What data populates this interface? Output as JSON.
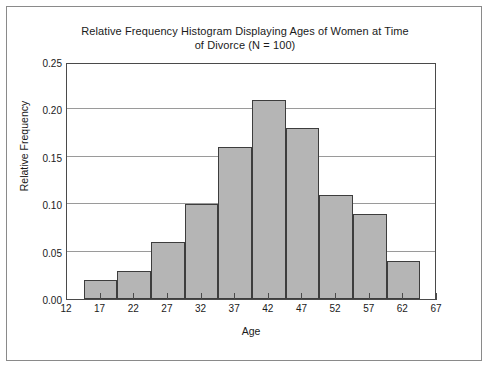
{
  "chart_data": {
    "type": "bar",
    "title": "Relative Frequency Histogram Displaying Ages of Women at Time of Divorce (N = 100)",
    "title_line1": "Relative Frequency Histogram Displaying Ages of Women at Time",
    "title_line2": "of Divorce (N = 100)",
    "xlabel": "Age",
    "ylabel": "Relative Frequency",
    "categories": [
      17,
      22,
      27,
      32,
      37,
      42,
      47,
      52,
      57,
      62
    ],
    "values": [
      0.02,
      0.03,
      0.06,
      0.1,
      0.16,
      0.21,
      0.18,
      0.11,
      0.09,
      0.04
    ],
    "bins": [
      {
        "center": 17,
        "lower": 14.5,
        "upper": 19.5,
        "value": 0.02
      },
      {
        "center": 22,
        "lower": 19.5,
        "upper": 24.5,
        "value": 0.03
      },
      {
        "center": 27,
        "lower": 24.5,
        "upper": 29.5,
        "value": 0.06
      },
      {
        "center": 32,
        "lower": 29.5,
        "upper": 34.5,
        "value": 0.1
      },
      {
        "center": 37,
        "lower": 34.5,
        "upper": 39.5,
        "value": 0.16
      },
      {
        "center": 42,
        "lower": 39.5,
        "upper": 44.5,
        "value": 0.21
      },
      {
        "center": 47,
        "lower": 44.5,
        "upper": 49.5,
        "value": 0.18
      },
      {
        "center": 52,
        "lower": 49.5,
        "upper": 54.5,
        "value": 0.11
      },
      {
        "center": 57,
        "lower": 54.5,
        "upper": 59.5,
        "value": 0.09
      },
      {
        "center": 62,
        "lower": 59.5,
        "upper": 64.5,
        "value": 0.04
      }
    ],
    "xlim": [
      12,
      67
    ],
    "ylim": [
      0.0,
      0.25
    ],
    "xticks": [
      12,
      17,
      22,
      27,
      32,
      37,
      42,
      47,
      52,
      57,
      62,
      67
    ],
    "xtick_labels": [
      "12",
      "17",
      "22",
      "27",
      "32",
      "37",
      "42",
      "47",
      "52",
      "57",
      "62",
      "67"
    ],
    "yticks": [
      0.0,
      0.05,
      0.1,
      0.15,
      0.2,
      0.25
    ],
    "ytick_labels": [
      "0.00",
      "0.05",
      "0.10",
      "0.15",
      "0.20",
      "0.25"
    ],
    "grid": "horizontal",
    "legend": "none",
    "sample_size": 100,
    "colors": {
      "bar_fill": "#b5b5b5",
      "bar_edge": "#3d3d3d",
      "gridline": "#9a9a9a",
      "axis": "#4a4a4a",
      "text": "#1a1a1a",
      "background": "#ffffff",
      "frame": "#8a8a8a"
    }
  }
}
